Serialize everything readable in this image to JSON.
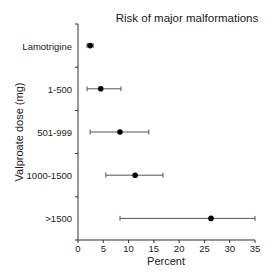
{
  "chart_data": {
    "type": "scatter",
    "subtype": "forest-plot-horizontal-error-bars",
    "title": "Risk of major malformations",
    "xlabel": "Percent",
    "ylabel": "Valproate dose (mg)",
    "xlim": [
      0,
      35
    ],
    "xticks": [
      0,
      5,
      10,
      15,
      20,
      25,
      30,
      35
    ],
    "grid": false,
    "legend": null,
    "categories": [
      "Lamotrigine",
      "1-500",
      "501-999",
      "1000-1500",
      ">1500"
    ],
    "values": [
      2.4,
      4.5,
      8.3,
      11.3,
      26.3
    ],
    "ci_lower": [
      1.8,
      1.8,
      2.4,
      5.5,
      8.3
    ],
    "ci_upper": [
      3.0,
      8.5,
      14.0,
      16.8,
      35.0
    ]
  }
}
